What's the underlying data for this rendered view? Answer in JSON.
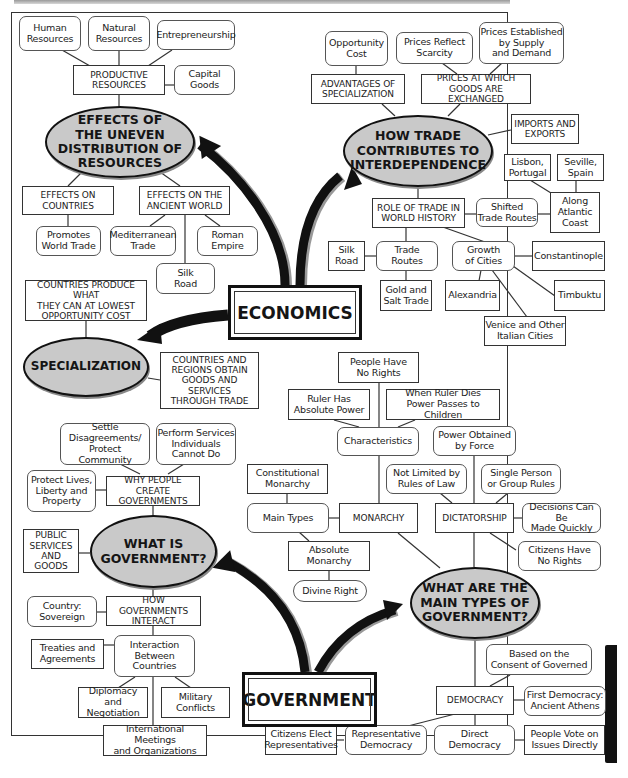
{
  "economics": {
    "hub": "ECONOMICS",
    "uneven_distribution": {
      "title": "EFFECTS OF\nTHE UNEVEN\nDISTRIBUTION OF\nRESOURCES",
      "productive_resources": "PRODUCTIVE\nRESOURCES",
      "resources": [
        "Human\nResources",
        "Natural\nResources",
        "Entrepreneurship",
        "Capital\nGoods"
      ],
      "effects_on_countries": "EFFECTS ON\nCOUNTRIES",
      "promotes_world_trade": "Promotes\nWorld Trade",
      "effects_on_ancient_world": "EFFECTS ON THE\nANCIENT WORLD",
      "ancient_items": [
        "Mediterranean\nTrade",
        "Roman\nEmpire",
        "Silk\nRoad"
      ]
    },
    "trade_interdependence": {
      "title": "HOW TRADE\nCONTRIBUTES TO\nINTERDEPENDENCE",
      "advantages": "ADVANTAGES OF\nSPECIALIZATION",
      "opportunity_cost": "Opportunity\nCost",
      "prices_exchanged": "PRICES AT WHICH\nGOODS ARE EXCHANGED",
      "prices_scarcity": "Prices Reflect\nScarcity",
      "prices_supply_demand": "Prices Established\nby Supply\nand Demand",
      "imports_exports": "IMPORTS AND\nEXPORTS",
      "role_of_trade": "ROLE OF TRADE IN\nWORLD HISTORY",
      "shifted_routes": "Shifted\nTrade Routes",
      "atlantic_coast": "Along\nAtlantic\nCoast",
      "lisbon": "Lisbon,\nPortugal",
      "seville": "Seville,\nSpain",
      "trade_routes": "Trade\nRoutes",
      "silk_road": "Silk\nRoad",
      "gold_salt": "Gold and\nSalt Trade",
      "growth_of_cities": "Growth\nof Cities",
      "cities": [
        "Constantinople",
        "Alexandria",
        "Timbuktu",
        "Venice and Other\nItalian Cities"
      ]
    },
    "specialization": {
      "title": "SPECIALIZATION",
      "produce": "COUNTRIES PRODUCE WHAT\nTHEY CAN AT LOWEST\nOPPORTUNITY COST",
      "obtain": "COUNTRIES AND\nREGIONS OBTAIN\nGOODS AND SERVICES\nTHROUGH TRADE"
    }
  },
  "government": {
    "hub": "GOVERNMENT",
    "what_is": {
      "title": "WHAT IS\nGOVERNMENT?",
      "why_create": "WHY PEOPLE CREATE\nGOVERNMENTS",
      "reasons": [
        "Settle\nDisagreements/\nProtect Community",
        "Perform Services\nIndividuals\nCannot Do",
        "Protect Lives,\nLiberty and\nProperty"
      ],
      "public_services": "PUBLIC\nSERVICES\nAND GOODS",
      "how_interact": "HOW GOVERNMENTS\nINTERACT",
      "sovereign": "Country:\nSovereign",
      "interaction": "Interaction\nBetween\nCountries",
      "interaction_items": [
        "Treaties and\nAgreements",
        "Diplomacy and\nNegotiation",
        "Military\nConflicts",
        "International Meetings\nand Organizations"
      ]
    },
    "main_types": {
      "title": "WHAT ARE THE\nMAIN TYPES OF\nGOVERNMENT?",
      "monarchy": {
        "label": "MONARCHY",
        "characteristics": "Characteristics",
        "char_items": [
          "People Have\nNo Rights",
          "Ruler Has\nAbsolute Power",
          "When Ruler Dies\nPower Passes to Children"
        ],
        "main_types": "Main Types",
        "constitutional": "Constitutional\nMonarchy",
        "absolute": "Absolute\nMonarchy",
        "divine_right": "Divine Right"
      },
      "dictatorship": {
        "label": "DICTATORSHIP",
        "items": [
          "Power Obtained\nby Force",
          "Not Limited by\nRules of Law",
          "Single Person\nor Group Rules",
          "Decisions Can Be\nMade Quickly",
          "Citizens Have\nNo Rights"
        ]
      },
      "democracy": {
        "label": "DEMOCRACY",
        "consent": "Based on the\nConsent of Governed",
        "first": "First Democracy:\nAncient Athens",
        "representative": "Representative\nDemocracy",
        "citizens_elect": "Citizens Elect\nRepresentatives",
        "direct": "Direct\nDemocracy",
        "people_vote": "People Vote on\nIssues Directly"
      }
    }
  },
  "colors": {
    "oval_fill": "#c9c9c9",
    "line": "#333333",
    "arrow": "#111111"
  }
}
